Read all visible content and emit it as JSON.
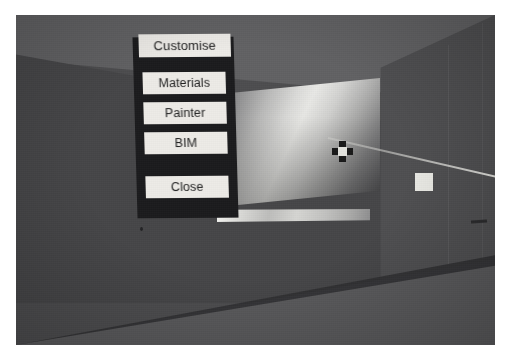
{
  "scene": {
    "description": "Virtual-reality interior corridor view with a floating menu panel",
    "colors": {
      "wall": "#4d4d4f",
      "wall_shadow": "#464648",
      "ceiling": "#616163",
      "floor": "#5a5a5c",
      "skirting": "#2e2e30",
      "menu_background": "#1b1b1d",
      "menu_button_face": "#eceae6",
      "menu_button_text": "#1c1c1c",
      "pointer_ray": "#f0f0eb",
      "target_marker": "#e9e9e4",
      "reticle_arms": "#191919",
      "reticle_hub": "#e2e2dd"
    }
  },
  "menu": {
    "title": "Customise",
    "items": [
      {
        "label": "Materials"
      },
      {
        "label": "Painter"
      },
      {
        "label": "BIM"
      },
      {
        "label": "Close"
      }
    ]
  },
  "viewport": {
    "display_panel_name": "gradient-display-surface",
    "display_strip_name": "display-light-strip",
    "reticle_name": "pointer-reticle",
    "ray_name": "pointer-ray",
    "target_name": "selection-target"
  }
}
